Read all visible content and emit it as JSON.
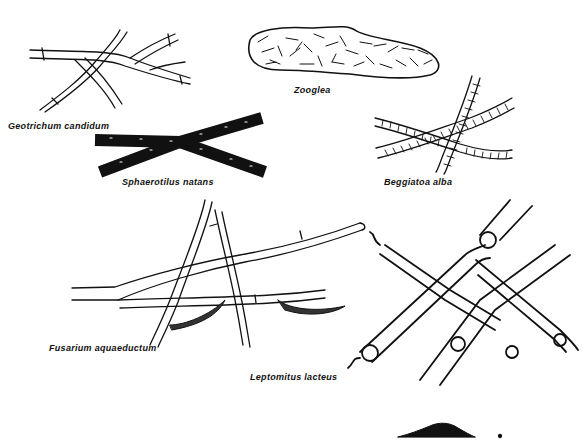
{
  "figure": {
    "background": "#ffffff",
    "ink_color": "#111111",
    "organisms": [
      {
        "id": "geotrichum",
        "label": "Geotrichum candidum",
        "x": 8,
        "y": 123
      },
      {
        "id": "zooglea",
        "label": "Zooglea",
        "x": 294,
        "y": 87
      },
      {
        "id": "sphaerotilus",
        "label": "Sphaerotilus natans",
        "x": 122,
        "y": 178
      },
      {
        "id": "beggiatoa",
        "label": "Beggiatoa alba",
        "x": 384,
        "y": 178
      },
      {
        "id": "fusarium",
        "label": "Fusarium aquaeductum",
        "x": 49,
        "y": 344
      },
      {
        "id": "leptomitus",
        "label": "Leptomitus lacteus",
        "x": 250,
        "y": 373
      }
    ]
  }
}
